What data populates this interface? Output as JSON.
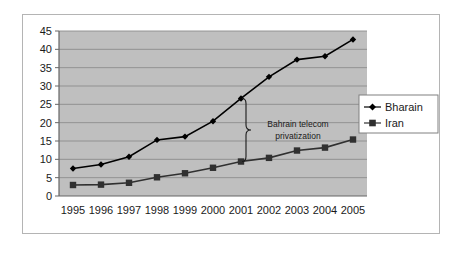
{
  "chart_data": {
    "type": "line",
    "title": "",
    "subtitle": "",
    "xlabel": "",
    "ylabel": "",
    "categories": [
      "1995",
      "1996",
      "1997",
      "1998",
      "1999",
      "2000",
      "2001",
      "2002",
      "2003",
      "2004",
      "2005"
    ],
    "series": [
      {
        "name": "Bharain",
        "marker": "diamond",
        "color": "#000000",
        "values": [
          7.5,
          8.6,
          10.7,
          15.3,
          16.2,
          20.4,
          26.6,
          32.5,
          37.2,
          38.1,
          42.7
        ]
      },
      {
        "name": "Iran",
        "marker": "square",
        "color": "#303030",
        "values": [
          3.0,
          3.1,
          3.6,
          5.1,
          6.2,
          7.7,
          9.4,
          10.4,
          12.4,
          13.2,
          15.4
        ]
      }
    ],
    "ylim": [
      0,
      45
    ],
    "ytick_labels": [
      "0",
      "5",
      "10",
      "15",
      "20",
      "25",
      "30",
      "35",
      "40",
      "45"
    ],
    "ytick_values": [
      0,
      5,
      10,
      15,
      20,
      25,
      30,
      35,
      40,
      45
    ],
    "xtick_labels": [
      "1995",
      "1996",
      "1997",
      "1998",
      "1999",
      "2000",
      "2001",
      "2002",
      "2003",
      "2004",
      "2005"
    ],
    "grid": "horizontal",
    "plot_background": "#bfbfbf",
    "legend_position": "right",
    "annotations": [
      {
        "name": "bahrain-telecom-privatization",
        "line1": "Bahrain  telecom",
        "line2": "privatization",
        "at_category": "2001",
        "brace_top_value": 26.6,
        "brace_bottom_value": 9.4
      }
    ]
  },
  "legend": {
    "entries": [
      {
        "label": "Bharain",
        "marker": "diamond"
      },
      {
        "label": "Iran",
        "marker": "square"
      }
    ]
  }
}
